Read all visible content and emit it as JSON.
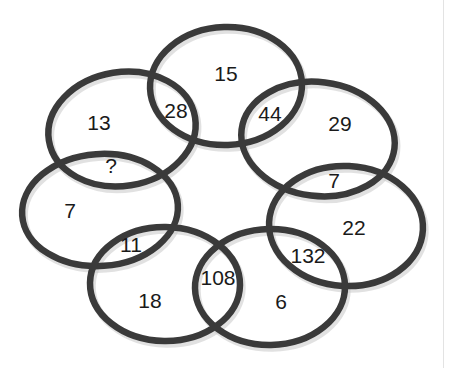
{
  "diagram": {
    "type": "venn-ring-puzzle",
    "background_color": "#ffffff",
    "stroke_color": "#3a3a3a",
    "text_color": "#1a1a1a",
    "shadow_color": "#c9c9c9",
    "edge_rule_color": "#e3e3e3",
    "unknown_marker": "?",
    "ellipse_count": 7,
    "ellipses": [
      {
        "name": "top",
        "cx": 226,
        "cy": 86,
        "rx": 76,
        "ry": 59,
        "rotate": -2
      },
      {
        "name": "upper-left",
        "cx": 122,
        "cy": 129,
        "rx": 74,
        "ry": 57,
        "rotate": -9
      },
      {
        "name": "upper-right",
        "cx": 318,
        "cy": 139,
        "rx": 77,
        "ry": 57,
        "rotate": 7
      },
      {
        "name": "left",
        "cx": 100,
        "cy": 210,
        "rx": 78,
        "ry": 56,
        "rotate": -4
      },
      {
        "name": "right",
        "cx": 346,
        "cy": 226,
        "rx": 77,
        "ry": 60,
        "rotate": 3
      },
      {
        "name": "lower-left",
        "cx": 165,
        "cy": 284,
        "rx": 75,
        "ry": 57,
        "rotate": 1
      },
      {
        "name": "lower-right",
        "cx": 270,
        "cy": 287,
        "rx": 75,
        "ry": 58,
        "rotate": -1
      }
    ],
    "labels": [
      {
        "id": "top-center",
        "text": "15",
        "x": 226,
        "y": 75,
        "region": "top-ellipse"
      },
      {
        "id": "top-left-overlap",
        "text": "28",
        "x": 176,
        "y": 112,
        "region": "top ∩ upper-left"
      },
      {
        "id": "top-right-overlap",
        "text": "44",
        "x": 270,
        "y": 115,
        "region": "top ∩ upper-right"
      },
      {
        "id": "upper-left-center",
        "text": "13",
        "x": 99,
        "y": 124,
        "region": "upper-left-ellipse"
      },
      {
        "id": "upper-left-overlap",
        "text": "?",
        "x": 111,
        "y": 167,
        "region": "upper-left ∩ left"
      },
      {
        "id": "upper-right-center",
        "text": "29",
        "x": 340,
        "y": 125,
        "region": "upper-right-ellipse"
      },
      {
        "id": "upper-right-overlap",
        "text": "7",
        "x": 334,
        "y": 182,
        "region": "upper-right ∩ right"
      },
      {
        "id": "left-center",
        "text": "7",
        "x": 70,
        "y": 212,
        "region": "left-ellipse"
      },
      {
        "id": "left-lower-overlap",
        "text": "11",
        "x": 131,
        "y": 246,
        "region": "left ∩ lower-left"
      },
      {
        "id": "right-center",
        "text": "22",
        "x": 354,
        "y": 229,
        "region": "right-ellipse"
      },
      {
        "id": "right-lower-overlap",
        "text": "132",
        "x": 308,
        "y": 257,
        "region": "right ∩ lower-right"
      },
      {
        "id": "lower-left-center",
        "text": "18",
        "x": 150,
        "y": 302,
        "region": "lower-left-ellipse"
      },
      {
        "id": "bottom-overlap",
        "text": "108",
        "x": 218,
        "y": 279,
        "region": "lower-left ∩ lower-right"
      },
      {
        "id": "lower-right-center",
        "text": "6",
        "x": 281,
        "y": 303,
        "region": "lower-right-ellipse"
      }
    ],
    "edge_rule": {
      "x": 443
    }
  }
}
